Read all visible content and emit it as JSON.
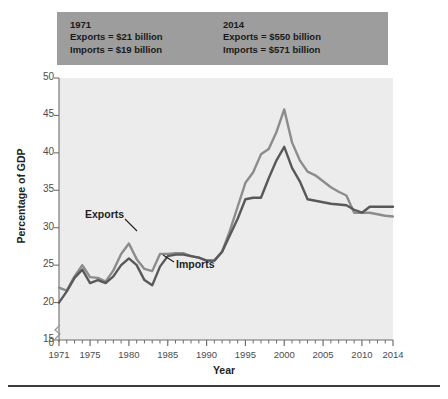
{
  "figure": {
    "bottom_rule": true,
    "plot_background": "#ececec",
    "callout_background": "#9d9d9d"
  },
  "callout": {
    "left": {
      "year": "1971",
      "exports": "Exports = $21 billion",
      "imports": "Imports = $19 billion"
    },
    "right": {
      "year": "2014",
      "exports": "Exports = $550 billion",
      "imports": "Imports = $571 billion"
    }
  },
  "chart_data": {
    "type": "line",
    "title": "",
    "xlabel": "Year",
    "ylabel": "Percentage of GDP",
    "xlim": [
      1971,
      2014
    ],
    "ylim": [
      15,
      50
    ],
    "y_axis_break": true,
    "y_break_value": 0,
    "yticks": [
      "0",
      "15",
      "20",
      "25",
      "30",
      "35",
      "40",
      "45",
      "50"
    ],
    "ytick_values": [
      0,
      15,
      20,
      25,
      30,
      35,
      40,
      45,
      50
    ],
    "xticks": [
      "1971",
      "1975",
      "1980",
      "1985",
      "1990",
      "1995",
      "2000",
      "2005",
      "2010",
      "2014"
    ],
    "xtick_values": [
      1971,
      1975,
      1980,
      1985,
      1990,
      1995,
      2000,
      2005,
      2010,
      2014
    ],
    "grid": false,
    "legend": "inline-annotations",
    "x": [
      1971,
      1972,
      1973,
      1974,
      1975,
      1976,
      1977,
      1978,
      1979,
      1980,
      1981,
      1982,
      1983,
      1984,
      1985,
      1986,
      1987,
      1988,
      1989,
      1990,
      1991,
      1992,
      1993,
      1994,
      1995,
      1996,
      1997,
      1998,
      1999,
      2000,
      2001,
      2002,
      2003,
      2004,
      2005,
      2006,
      2007,
      2008,
      2009,
      2010,
      2011,
      2012,
      2013,
      2014
    ],
    "series": [
      {
        "name": "Exports",
        "color": "#8c8c8c",
        "values": [
          22.0,
          21.6,
          23.5,
          25.0,
          23.4,
          23.3,
          22.8,
          24.3,
          26.5,
          27.9,
          25.8,
          24.5,
          24.2,
          26.5,
          26.5,
          26.6,
          26.6,
          26.2,
          26.0,
          25.6,
          25.6,
          26.8,
          29.6,
          32.8,
          36.0,
          37.4,
          39.8,
          40.5,
          42.8,
          45.8,
          41.4,
          39.0,
          37.5,
          37.0,
          36.2,
          35.4,
          34.8,
          34.3,
          32.0,
          32.0,
          32.0,
          31.8,
          31.6,
          31.5
        ]
      },
      {
        "name": "Imports",
        "color": "#59595b",
        "values": [
          20.0,
          21.5,
          23.3,
          24.4,
          22.6,
          23.0,
          22.6,
          23.5,
          25.0,
          25.9,
          25.0,
          23.0,
          22.3,
          24.8,
          26.2,
          26.4,
          26.4,
          26.2,
          26.0,
          25.6,
          25.6,
          26.8,
          29.0,
          31.2,
          33.8,
          34.0,
          34.0,
          36.6,
          39.0,
          40.8,
          38.0,
          36.2,
          33.8,
          33.6,
          33.4,
          33.2,
          33.1,
          33.0,
          32.4,
          32.0,
          32.8,
          32.8,
          32.8,
          32.8
        ]
      }
    ],
    "annotations": [
      {
        "text": "Exports",
        "series": "Exports"
      },
      {
        "text": "Imports",
        "series": "Imports"
      }
    ]
  }
}
